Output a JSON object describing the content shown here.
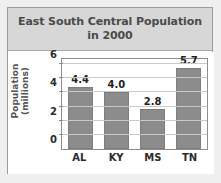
{
  "chart_data": {
    "type": "bar",
    "title": "East South Central Population in 2000",
    "title_lines": [
      "East South Central Population",
      "in 2000"
    ],
    "categories": [
      "AL",
      "KY",
      "MS",
      "TN"
    ],
    "values": [
      4.4,
      4.0,
      2.8,
      5.7
    ],
    "value_labels": [
      "4.4",
      "4.0",
      "2.8",
      "5.7"
    ],
    "xlabel": "",
    "ylabel": "Population (millions)",
    "ylabel_lines": [
      "Population",
      "(millions)"
    ],
    "ylim": [
      0,
      6.5
    ],
    "ytick_values": [
      0,
      2,
      4,
      6
    ],
    "ytick_labels": [
      "0",
      "2",
      "4",
      "6"
    ],
    "gridline_values": [
      1,
      2,
      3,
      4,
      5,
      6
    ],
    "grid": true,
    "legend": false,
    "legend_position": "none",
    "bar_color": "#8c8c8c",
    "title_band_color": "#d7d7d7",
    "title_text_color": "#4a4a4a",
    "plot_background": "#ffffff",
    "gridline_color": "#c9c9c9",
    "axis_color": "#8d8d8d",
    "page_background": "#efefef",
    "card_background": "#ffffff"
  }
}
